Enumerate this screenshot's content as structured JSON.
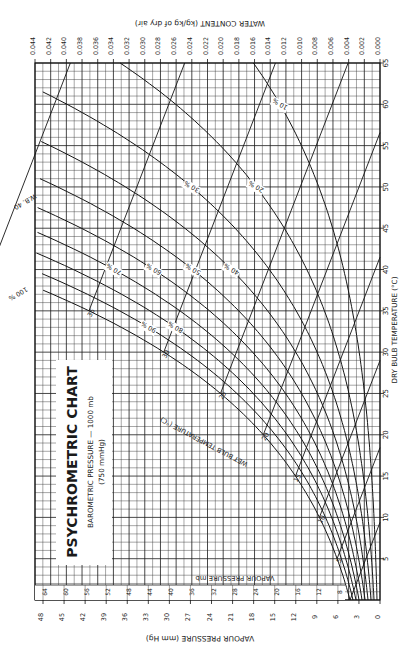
{
  "title": {
    "main": "PSYCHROMETRIC CHART",
    "sub1": "BAROMETRIC PRESSURE — 1000 mb",
    "sub2": "(750 mmHg)"
  },
  "axes": {
    "water_content_label": "WATER CONTENT (kg/kg of dry air)",
    "dry_bulb_label": "DRY BULB TEMPERATURE (°C)",
    "vapour_mmhg_label": "VAPOUR PRESSURE (mm Hg)",
    "vapour_mb_label": "VAPOUR PRESSURE mb",
    "wet_bulb_label": "WET BULB TEMPERATURE (°C)",
    "wb_marker": "W.B. 40",
    "saturation_marker": "100 %",
    "specific_volume_label": "SPECIFIC VOLUME"
  },
  "colors": {
    "ink": "#151515",
    "grid": "#3a3a3a",
    "paper": "#ffffff"
  },
  "chart_data": {
    "type": "line",
    "title": "PSYCHROMETRIC CHART",
    "subtitle": "BAROMETRIC PRESSURE — 1000 mb (750 mmHg)",
    "orientation": "rotated 90° clockwise (dry bulb increases upward along right edge)",
    "xlabel": "DRY BULB TEMPERATURE (°C)",
    "ylabel": "WATER CONTENT (kg/kg of dry air)",
    "xlim": [
      0,
      65
    ],
    "ylim": [
      0,
      0.044
    ],
    "dry_bulb_ticks": [
      5,
      10,
      15,
      20,
      25,
      30,
      35,
      40,
      45,
      50,
      55,
      60,
      65
    ],
    "water_content_ticks": [
      "0.000",
      "0.002",
      "0.004",
      "0.006",
      "0.008",
      "0.010",
      "0.012",
      "0.014",
      "0.016",
      "0.018",
      "0.020",
      "0.022",
      "0.024",
      "0.026",
      "0.028",
      "0.030",
      "0.032",
      "0.034",
      "0.036",
      "0.038",
      "0.040",
      "0.042",
      "0.044"
    ],
    "vapour_pressure_mmhg_ticks": [
      0,
      3,
      6,
      9,
      12,
      15,
      18,
      21,
      24,
      27,
      30,
      33,
      36,
      39,
      42,
      45,
      48
    ],
    "vapour_pressure_mb_ticks": [
      8,
      12,
      16,
      20,
      24,
      28,
      32,
      36,
      40,
      44,
      48,
      52,
      56,
      60,
      64
    ],
    "relative_humidity_curves": [
      {
        "name": "100 %",
        "rh": 100
      },
      {
        "name": "90 %",
        "rh": 90
      },
      {
        "name": "80 %",
        "rh": 80
      },
      {
        "name": "70 %",
        "rh": 70
      },
      {
        "name": "60 %",
        "rh": 60
      },
      {
        "name": "50 %",
        "rh": 50
      },
      {
        "name": "40 %",
        "rh": 40
      },
      {
        "name": "30 %",
        "rh": 30
      },
      {
        "name": "20 %",
        "rh": 20
      },
      {
        "name": "10 %",
        "rh": 10
      }
    ],
    "wet_bulb_lines_c": [
      0,
      5,
      10,
      15,
      20,
      25,
      30,
      35,
      40
    ],
    "wet_bulb_labels": [
      "5",
      "10",
      "15",
      "20",
      "25",
      "30",
      "35"
    ],
    "grid": true
  }
}
